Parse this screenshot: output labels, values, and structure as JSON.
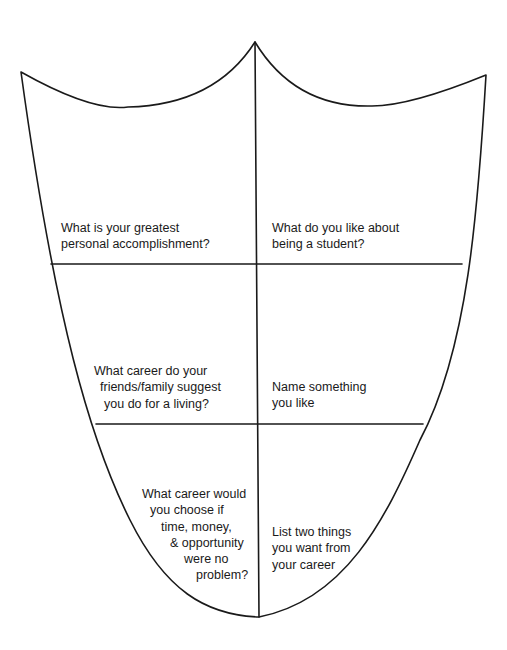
{
  "diagram": {
    "type": "shield-worksheet",
    "line_color": "#1a1a1a",
    "background": "#ffffff",
    "sections": [
      {
        "id": "top-left",
        "lines": [
          "What is your greatest",
          "personal accomplishment?"
        ]
      },
      {
        "id": "top-right",
        "lines": [
          "What do you like about",
          "being a student?"
        ]
      },
      {
        "id": "middle-left",
        "lines": [
          "What career do your",
          "friends/family suggest",
          "you do for a living?"
        ]
      },
      {
        "id": "middle-right",
        "lines": [
          "Name something",
          "you like"
        ]
      },
      {
        "id": "bottom-left",
        "lines": [
          "What career would",
          "you choose if",
          "time, money,",
          "& opportunity",
          "were no",
          "problem?"
        ]
      },
      {
        "id": "bottom-right",
        "lines": [
          "List two things",
          "you want from",
          "your career"
        ]
      }
    ]
  }
}
